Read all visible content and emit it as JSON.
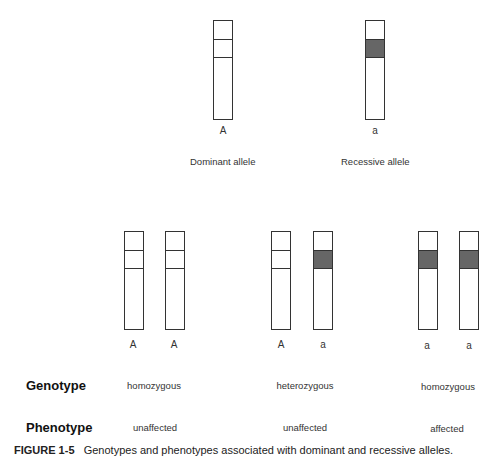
{
  "top": {
    "dominant": {
      "allele_label": "A",
      "caption": "Dominant allele"
    },
    "recessive": {
      "allele_label": "a",
      "caption": "Recessive allele"
    }
  },
  "pairs": [
    {
      "left": "A",
      "right": "A",
      "genotype": "homozygous",
      "phenotype": "unaffected"
    },
    {
      "left": "A",
      "right": "a",
      "genotype": "heterozygous",
      "phenotype": "unaffected"
    },
    {
      "left": "a",
      "right": "a",
      "genotype": "homozygous",
      "phenotype": "affected"
    }
  ],
  "rows": {
    "genotype_label": "Genotype",
    "phenotype_label": "Phenotype"
  },
  "caption": {
    "figure": "FIGURE 1-5",
    "text": "Genotypes and phenotypes associated with dominant and recessive alleles."
  },
  "colors": {
    "shaded_band": "#666666",
    "outline": "#333333"
  }
}
